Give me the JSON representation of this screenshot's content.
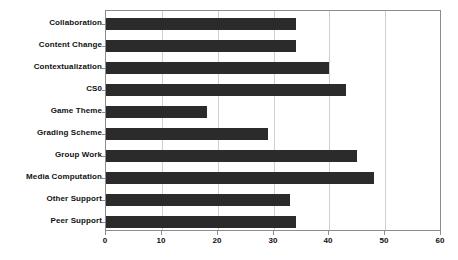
{
  "chart_data": {
    "type": "bar",
    "orientation": "horizontal",
    "title": "",
    "xlabel": "",
    "ylabel": "",
    "xlim": [
      0,
      60
    ],
    "xticks": [
      0,
      10,
      20,
      30,
      40,
      50,
      60
    ],
    "grid": true,
    "legend": false,
    "bar_color": "#2b2b2b",
    "categories": [
      "Collaboration",
      "Content Change",
      "Contextualization",
      "CS0",
      "Game Theme",
      "Grading Scheme",
      "Group Work",
      "Media Computation",
      "Other Support",
      "Peer Support"
    ],
    "values": [
      34,
      34,
      40,
      43,
      18,
      29,
      45,
      48,
      33,
      34
    ]
  },
  "colors": {
    "bar": "#2b2b2b",
    "frame": "#8c8c8c",
    "gridline": "#cfcfcf",
    "text": "#111111",
    "background": "#ffffff"
  }
}
